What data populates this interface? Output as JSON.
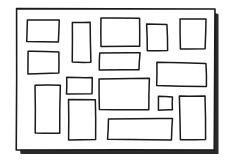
{
  "canvas": {
    "width": 233,
    "height": 165,
    "background_color": "#ffffff",
    "title": "hand-drawn rectangle layout sketch"
  },
  "style": {
    "ink_color": "#1a1a1a",
    "shadow_color": "#2b2b2b",
    "fill_color": "#ffffff",
    "frame_stroke_width": 1.6,
    "box_stroke_width": 1.5
  },
  "outer_frame": {
    "name": "page-border",
    "x": 16.5,
    "y": 9.0,
    "width": 198.0,
    "height": 141.0,
    "shadow_offset": 4.0
  },
  "chart_data": {
    "type": "table",
    "xlabel": "x (px)",
    "ylabel": "y (px)",
    "xlim": [
      0,
      233
    ],
    "ylim": [
      0,
      165
    ],
    "columns": [
      "id",
      "label",
      "x",
      "y",
      "width",
      "height"
    ],
    "rows": [
      [
        "box-1",
        "top-left-wide",
        27.0,
        19.5,
        32.0,
        22.5
      ],
      [
        "box-2",
        "left-upper-wide",
        28.0,
        51.5,
        31.0,
        22.0
      ],
      [
        "box-3",
        "left-tall",
        35.0,
        85.5,
        25.0,
        47.5
      ],
      [
        "box-4",
        "upper-mid-vertical",
        72.0,
        22.0,
        18.5,
        40.0
      ],
      [
        "box-5",
        "mid-small-square",
        67.0,
        77.0,
        25.0,
        16.5
      ],
      [
        "box-6",
        "lower-mid-tall",
        68.0,
        99.5,
        27.0,
        40.5
      ],
      [
        "box-7",
        "top-center-large",
        101.0,
        18.5,
        39.0,
        28.0
      ],
      [
        "box-8",
        "center-wide-thin",
        99.5,
        53.0,
        40.0,
        17.5
      ],
      [
        "box-9",
        "center-large",
        99.0,
        78.5,
        50.0,
        31.5
      ],
      [
        "box-10",
        "bottom-center-wide",
        108.0,
        118.5,
        64.0,
        21.0
      ],
      [
        "box-11",
        "right-upper-narrow",
        147.0,
        24.0,
        20.5,
        26.5
      ],
      [
        "box-12",
        "right-middle-wide",
        157.0,
        63.0,
        49.0,
        23.0
      ],
      [
        "box-13",
        "right-tiny-square",
        158.0,
        97.0,
        14.0,
        13.0
      ],
      [
        "box-14",
        "top-right-large",
        180.0,
        19.5,
        25.5,
        29.5
      ],
      [
        "box-15",
        "right-bottom-tall",
        180.0,
        96.0,
        25.5,
        44.0
      ]
    ],
    "count": 15,
    "grid": false,
    "legend": "none"
  },
  "boxes": [
    {
      "id": "box-1",
      "label": "top-left-wide",
      "x": 27.0,
      "y": 19.5,
      "w": 32.0,
      "h": 22.5
    },
    {
      "id": "box-2",
      "label": "left-upper-wide",
      "x": 28.0,
      "y": 51.5,
      "w": 31.0,
      "h": 22.0
    },
    {
      "id": "box-3",
      "label": "left-tall",
      "x": 35.0,
      "y": 85.5,
      "w": 25.0,
      "h": 47.5
    },
    {
      "id": "box-4",
      "label": "upper-mid-vertical",
      "x": 72.0,
      "y": 22.0,
      "w": 18.5,
      "h": 40.0
    },
    {
      "id": "box-5",
      "label": "mid-small-square",
      "x": 67.0,
      "y": 77.0,
      "w": 25.0,
      "h": 16.5
    },
    {
      "id": "box-6",
      "label": "lower-mid-tall",
      "x": 68.0,
      "y": 99.5,
      "w": 27.0,
      "h": 40.5
    },
    {
      "id": "box-7",
      "label": "top-center-large",
      "x": 101.0,
      "y": 18.5,
      "w": 39.0,
      "h": 28.0
    },
    {
      "id": "box-8",
      "label": "center-wide-thin",
      "x": 99.5,
      "y": 53.0,
      "w": 40.0,
      "h": 17.5
    },
    {
      "id": "box-9",
      "label": "center-large",
      "x": 99.0,
      "y": 78.5,
      "w": 50.0,
      "h": 31.5
    },
    {
      "id": "box-10",
      "label": "bottom-center-wide",
      "x": 108.0,
      "y": 118.5,
      "w": 64.0,
      "h": 21.0
    },
    {
      "id": "box-11",
      "label": "right-upper-narrow",
      "x": 147.0,
      "y": 24.0,
      "w": 20.5,
      "h": 26.5
    },
    {
      "id": "box-12",
      "label": "right-middle-wide",
      "x": 157.0,
      "y": 63.0,
      "w": 49.0,
      "h": 23.0
    },
    {
      "id": "box-13",
      "label": "right-tiny-square",
      "x": 158.0,
      "y": 97.0,
      "w": 14.0,
      "h": 13.0
    },
    {
      "id": "box-14",
      "label": "top-right-large",
      "x": 180.0,
      "y": 19.5,
      "w": 25.5,
      "h": 29.5
    },
    {
      "id": "box-15",
      "label": "right-bottom-tall",
      "x": 180.0,
      "y": 96.0,
      "w": 25.5,
      "h": 44.0
    }
  ]
}
